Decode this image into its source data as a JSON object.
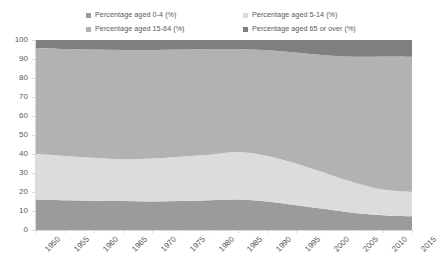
{
  "legend": {
    "position": "top",
    "items": [
      {
        "label": "Percentage aged 0-4 (%)",
        "color": "#9b9b9b",
        "key": "age_0_4"
      },
      {
        "label": "Percentage aged 5-14 (%)",
        "color": "#dcdcdc",
        "key": "age_5_14"
      },
      {
        "label": "Percentage aged 15-64 (%)",
        "color": "#b2b2b2",
        "key": "age_15_64"
      },
      {
        "label": "Percentage aged 65 or over (%)",
        "color": "#7f7f7f",
        "key": "age_65_over"
      }
    ]
  },
  "axes": {
    "y_ticks": [
      "0",
      "10",
      "20",
      "30",
      "40",
      "50",
      "60",
      "70",
      "80",
      "90",
      "100"
    ],
    "x_ticks": [
      "1950",
      "1955",
      "1960",
      "1965",
      "1970",
      "1975",
      "1980",
      "1985",
      "1990",
      "1995",
      "2000",
      "2005",
      "2010",
      "2015"
    ]
  },
  "chart_data": {
    "type": "area",
    "stacked": true,
    "normalized": true,
    "title": "",
    "xlabel": "",
    "ylabel": "",
    "ylim": [
      0,
      100
    ],
    "xlim": [
      1950,
      2015
    ],
    "grid": false,
    "legend_position": "top",
    "x": [
      1950,
      1955,
      1960,
      1965,
      1970,
      1975,
      1980,
      1985,
      1990,
      1995,
      2000,
      2005,
      2010,
      2015
    ],
    "categories": [
      "1950",
      "1955",
      "1960",
      "1965",
      "1970",
      "1975",
      "1980",
      "1985",
      "1990",
      "1995",
      "2000",
      "2005",
      "2010",
      "2015"
    ],
    "series": [
      {
        "name": "Percentage aged 0-4 (%)",
        "color": "#9b9b9b",
        "values": [
          16.0,
          15.6,
          15.4,
          15.2,
          15.0,
          15.2,
          15.6,
          16.0,
          15.0,
          13.0,
          11.0,
          9.0,
          7.8,
          7.2
        ]
      },
      {
        "name": "Percentage aged 5-14 (%)",
        "color": "#dcdcdc",
        "values": [
          24.0,
          23.4,
          22.6,
          22.0,
          22.6,
          23.4,
          24.0,
          25.0,
          24.0,
          22.0,
          19.0,
          16.0,
          13.5,
          12.8
        ]
      },
      {
        "name": "Percentage aged 15-64 (%)",
        "color": "#b2b2b2",
        "values": [
          55.6,
          56.2,
          57.0,
          57.6,
          57.2,
          56.4,
          55.6,
          54.2,
          55.6,
          58.4,
          62.0,
          66.2,
          70.0,
          71.2
        ]
      },
      {
        "name": "Percentage aged 65 or over (%)",
        "color": "#7f7f7f",
        "values": [
          4.4,
          4.8,
          5.0,
          5.2,
          5.2,
          5.0,
          4.8,
          4.8,
          5.4,
          6.6,
          8.0,
          8.8,
          8.7,
          8.8
        ]
      }
    ],
    "cumulative_boundaries": {
      "note": "running top edge of each band, bottom-up",
      "age_0_4": [
        16.0,
        15.6,
        15.4,
        15.2,
        15.0,
        15.2,
        15.6,
        16.0,
        15.0,
        13.0,
        11.0,
        9.0,
        7.8,
        7.2
      ],
      "age_0_14": [
        40.0,
        39.0,
        38.0,
        37.2,
        37.6,
        38.6,
        39.6,
        41.0,
        39.0,
        35.0,
        30.0,
        25.0,
        21.3,
        20.0
      ],
      "age_0_64": [
        95.6,
        95.2,
        95.0,
        94.8,
        94.8,
        95.0,
        95.2,
        95.2,
        94.6,
        93.4,
        92.0,
        91.2,
        91.3,
        91.2
      ],
      "age_total": [
        100,
        100,
        100,
        100,
        100,
        100,
        100,
        100,
        100,
        100,
        100,
        100,
        100,
        100
      ]
    }
  }
}
